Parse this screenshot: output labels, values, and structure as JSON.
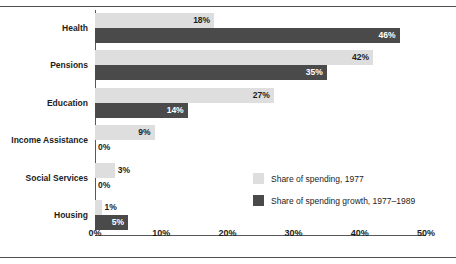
{
  "clipped_header_text": "",
  "chart_data": {
    "type": "bar",
    "orientation": "horizontal",
    "title": "",
    "xlabel": "",
    "ylabel": "",
    "xlim": [
      0,
      50
    ],
    "grid": false,
    "legend_position": "inside-right",
    "categories": [
      "Health",
      "Pensions",
      "Education",
      "Income Assistance",
      "Social Services",
      "Housing"
    ],
    "tick_labels": [
      "0%",
      "10%",
      "20%",
      "30%",
      "40%",
      "50%"
    ],
    "tick_values": [
      0,
      10,
      20,
      30,
      40,
      50
    ],
    "series": [
      {
        "name": "Share of spending, 1977",
        "color": "#dedede",
        "values": [
          18,
          42,
          27,
          9,
          3,
          1
        ],
        "labels": [
          "18%",
          "42%",
          "27%",
          "9%",
          "3%",
          "1%"
        ]
      },
      {
        "name": "Share of spending growth, 1977–1989",
        "color": "#4a4a4a",
        "values": [
          46,
          35,
          14,
          0,
          0,
          5
        ],
        "labels": [
          "46%",
          "35%",
          "14%",
          "0%",
          "0%",
          "5%"
        ]
      }
    ]
  }
}
